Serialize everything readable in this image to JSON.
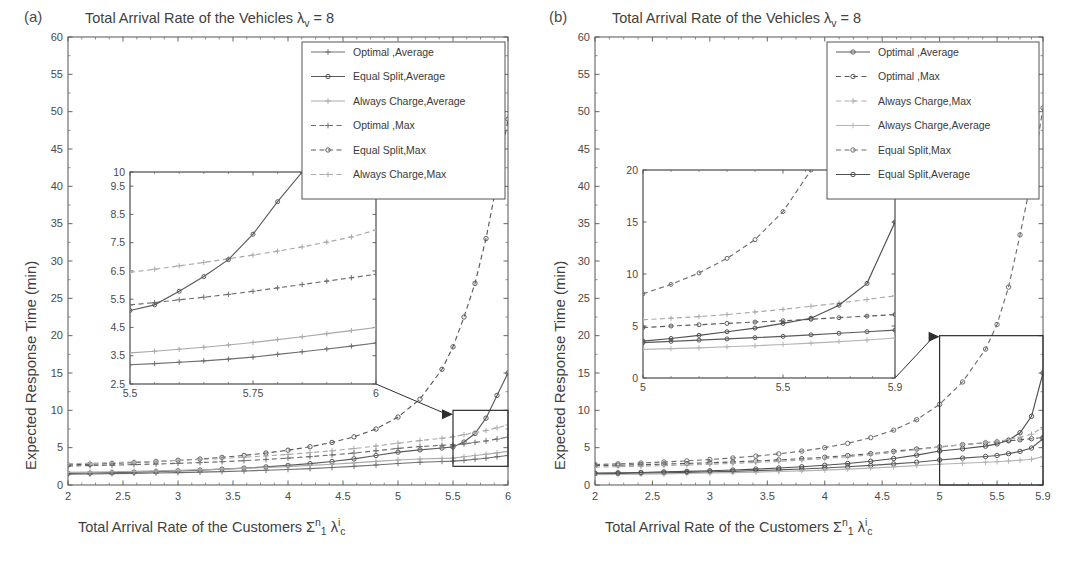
{
  "figure": {
    "width": 1078,
    "height": 565,
    "background": "#ffffff",
    "ink_color": "#4a4a4a"
  },
  "panels": [
    {
      "id": "a",
      "label": "(a)",
      "title_prefix": "Total Arrival Rate of the Vehicles ",
      "title_symbol": "λ",
      "title_sub": "v",
      "title_suffix": " = 8",
      "ylabel": "Expected Response Time (min)",
      "xlabel_prefix": "Total Arrival Rate of the Customers ",
      "xlabel_sigma": "Σ",
      "xlabel_sigma_sup": "n",
      "xlabel_sigma_sub": "1",
      "xlabel_lambda": "λ",
      "xlabel_lambda_sup": "i",
      "xlabel_lambda_sub": "c",
      "legend": [
        {
          "label": "Optimal ,Average",
          "style": "solid",
          "marker": "plus",
          "color": "#6e6e6e"
        },
        {
          "label": "Equal Split,Average",
          "style": "solid",
          "marker": "circle",
          "color": "#5a5a5a"
        },
        {
          "label": "Always Charge,Average",
          "style": "solid",
          "marker": "plus",
          "color": "#a9a9a9"
        },
        {
          "label": "Optimal ,Max",
          "style": "dashed",
          "marker": "plus",
          "color": "#6e6e6e"
        },
        {
          "label": "Equal Split,Max",
          "style": "dashed",
          "marker": "circle",
          "color": "#5a5a5a"
        },
        {
          "label": "Always Charge,Max",
          "style": "dashed",
          "marker": "plus",
          "color": "#a9a9a9"
        }
      ],
      "zoom_box": {
        "x0": 5.5,
        "x1": 6,
        "y0": 2.5,
        "y1": 10
      }
    },
    {
      "id": "b",
      "label": "(b)",
      "title_prefix": "Total Arrival Rate of the Vehicles ",
      "title_symbol": "λ",
      "title_sub": "v",
      "title_suffix": " = 8",
      "ylabel": "Expected Response Time (min)",
      "xlabel_prefix": "Total Arrival Rate of the Customers ",
      "xlabel_sigma": "Σ",
      "xlabel_sigma_sup": "n",
      "xlabel_sigma_sub": "1",
      "xlabel_lambda": "λ",
      "xlabel_lambda_sup": "i",
      "xlabel_lambda_sub": "c",
      "legend": [
        {
          "label": "Optimal ,Average",
          "style": "solid",
          "marker": "circle",
          "color": "#5a5a5a"
        },
        {
          "label": "Optimal ,Max",
          "style": "dashed",
          "marker": "circle",
          "color": "#5a5a5a"
        },
        {
          "label": "Always Charge,Max",
          "style": "dashed",
          "marker": "plus",
          "color": "#a9a9a9"
        },
        {
          "label": "Always Charge,Average",
          "style": "solid",
          "marker": "plus",
          "color": "#b4b4b4"
        },
        {
          "label": "Equal Split,Max",
          "style": "dashed",
          "marker": "circle",
          "color": "#6e6e6e"
        },
        {
          "label": "Equal Split,Average",
          "style": "solid",
          "marker": "circle",
          "color": "#4f4f4f"
        }
      ],
      "zoom_box": {
        "x0": 5.0,
        "x1": 5.9,
        "y0": 0,
        "y1": 20
      }
    }
  ],
  "chart_data": [
    {
      "id": "panel-a-main",
      "type": "line",
      "title": "Total Arrival Rate of the Vehicles λ_v = 8",
      "xlabel": "Total Arrival Rate of the Customers Σ_1^n λ_c^i",
      "ylabel": "Expected Response Time (min)",
      "xlim": [
        2,
        6
      ],
      "ylim": [
        0,
        60
      ],
      "xticks": [
        2,
        2.5,
        3,
        3.5,
        4,
        4.5,
        5,
        5.5,
        6
      ],
      "xticklabels": [
        "2",
        "2.5",
        "3",
        "3.5",
        "4",
        "4.5",
        "5",
        "5.5",
        "6"
      ],
      "yticks": [
        0,
        5,
        10,
        15,
        20,
        25,
        30,
        35,
        40,
        45,
        50,
        55,
        60
      ],
      "yticklabels": [
        "0",
        "5",
        "10",
        "15",
        "20",
        "25",
        "30",
        "35",
        "40",
        "45",
        "50",
        "55",
        "60"
      ],
      "grid": false,
      "legend_position": "upper-right",
      "x": [
        2,
        2.2,
        2.4,
        2.6,
        2.8,
        3.0,
        3.2,
        3.4,
        3.6,
        3.8,
        4.0,
        4.2,
        4.4,
        4.6,
        4.8,
        5.0,
        5.2,
        5.4,
        5.5,
        5.6,
        5.7,
        5.8,
        5.9,
        6.0
      ],
      "series": [
        {
          "name": "Optimal ,Average",
          "style": "solid",
          "marker": "plus",
          "color": "#6e6e6e",
          "values": [
            1.45,
            1.48,
            1.52,
            1.56,
            1.6,
            1.66,
            1.72,
            1.8,
            1.88,
            1.98,
            2.08,
            2.2,
            2.34,
            2.5,
            2.68,
            2.88,
            3.05,
            3.15,
            3.2,
            3.3,
            3.45,
            3.58,
            3.78,
            3.95
          ]
        },
        {
          "name": "Equal Split,Average",
          "style": "solid",
          "marker": "circle",
          "color": "#5a5a5a",
          "values": [
            1.55,
            1.6,
            1.66,
            1.72,
            1.8,
            1.9,
            2.0,
            2.12,
            2.26,
            2.42,
            2.62,
            2.86,
            3.14,
            3.5,
            3.95,
            4.4,
            4.7,
            4.95,
            5.1,
            5.75,
            6.9,
            8.95,
            12.0,
            15.0
          ]
        },
        {
          "name": "Always Charge,Average",
          "style": "solid",
          "marker": "plus",
          "color": "#a9a9a9",
          "values": [
            1.7,
            1.74,
            1.78,
            1.83,
            1.89,
            1.96,
            2.04,
            2.13,
            2.23,
            2.34,
            2.47,
            2.62,
            2.78,
            2.96,
            3.16,
            3.35,
            3.48,
            3.56,
            3.6,
            3.78,
            3.95,
            4.12,
            4.3,
            4.5
          ]
        },
        {
          "name": "Optimal ,Max",
          "style": "dashed",
          "marker": "plus",
          "color": "#6e6e6e",
          "values": [
            2.55,
            2.6,
            2.66,
            2.73,
            2.81,
            2.9,
            3.0,
            3.12,
            3.26,
            3.42,
            3.6,
            3.8,
            4.02,
            4.28,
            4.58,
            4.9,
            5.15,
            5.32,
            5.4,
            5.5,
            5.7,
            5.9,
            6.15,
            6.4
          ]
        },
        {
          "name": "Equal Split,Max",
          "style": "dashed",
          "marker": "circle",
          "color": "#5a5a5a",
          "values": [
            2.7,
            2.78,
            2.88,
            3.0,
            3.14,
            3.3,
            3.48,
            3.7,
            3.96,
            4.28,
            4.66,
            5.12,
            5.7,
            6.45,
            7.5,
            9.1,
            11.5,
            15.5,
            18.5,
            22.5,
            27.0,
            33.0,
            40.5,
            49.0
          ]
        },
        {
          "name": "Always Charge,Max",
          "style": "dashed",
          "marker": "plus",
          "color": "#a9a9a9",
          "values": [
            2.85,
            2.92,
            3.0,
            3.08,
            3.18,
            3.3,
            3.42,
            3.56,
            3.72,
            3.9,
            4.1,
            4.32,
            4.58,
            4.88,
            5.22,
            5.6,
            5.95,
            6.25,
            6.45,
            6.75,
            7.0,
            7.3,
            7.65,
            8.05
          ]
        }
      ]
    },
    {
      "id": "panel-a-inset",
      "type": "line",
      "xlim": [
        5.5,
        6
      ],
      "ylim": [
        2.5,
        10
      ],
      "xticks": [
        5.5,
        5.75,
        6
      ],
      "xticklabels": [
        "5.5",
        "5.75",
        "6"
      ],
      "yticks": [
        2.5,
        3.5,
        4.5,
        5.5,
        6.5,
        7.5,
        8.5,
        9.5,
        10
      ],
      "yticklabels": [
        "2.5",
        "3.5",
        "4.5",
        "5.5",
        "6.5",
        "7.5",
        "8.5",
        "9.5",
        "10"
      ],
      "x": [
        5.5,
        5.55,
        5.6,
        5.65,
        5.7,
        5.75,
        5.8,
        5.85,
        5.9,
        5.95,
        6.0
      ],
      "series": [
        {
          "name": "Optimal ,Average",
          "style": "solid",
          "marker": "plus",
          "color": "#6e6e6e",
          "values": [
            3.18,
            3.22,
            3.27,
            3.32,
            3.38,
            3.45,
            3.55,
            3.64,
            3.74,
            3.84,
            3.95
          ]
        },
        {
          "name": "Always Charge,Average",
          "style": "solid",
          "marker": "plus",
          "color": "#a9a9a9",
          "values": [
            3.6,
            3.66,
            3.73,
            3.8,
            3.88,
            3.97,
            4.07,
            4.17,
            4.28,
            4.39,
            4.5
          ]
        },
        {
          "name": "Optimal ,Max",
          "style": "dashed",
          "marker": "plus",
          "color": "#6e6e6e",
          "values": [
            5.3,
            5.38,
            5.48,
            5.57,
            5.67,
            5.78,
            5.9,
            6.02,
            6.14,
            6.26,
            6.38
          ]
        },
        {
          "name": "Always Charge,Max",
          "style": "dashed",
          "marker": "plus",
          "color": "#a9a9a9",
          "values": [
            6.45,
            6.56,
            6.68,
            6.8,
            6.93,
            7.06,
            7.2,
            7.35,
            7.52,
            7.7,
            7.95
          ]
        },
        {
          "name": "Equal Split,Average",
          "style": "solid",
          "marker": "circle",
          "color": "#5a5a5a",
          "values": [
            5.1,
            5.3,
            5.78,
            6.3,
            6.9,
            7.8,
            8.95,
            10.0,
            null,
            null,
            null
          ]
        }
      ]
    },
    {
      "id": "panel-b-main",
      "type": "line",
      "title": "Total Arrival Rate of the Vehicles λ_v = 8",
      "xlabel": "Total Arrival Rate of the Customers Σ_1^n λ_c^i",
      "ylabel": "Expected Response Time (min)",
      "xlim": [
        2,
        5.9
      ],
      "ylim": [
        0,
        60
      ],
      "xticks": [
        2,
        2.5,
        3,
        3.5,
        4,
        4.5,
        5,
        5.5,
        5.9
      ],
      "xticklabels": [
        "2",
        "2.5",
        "3",
        "3.5",
        "4",
        "4.5",
        "5",
        "5.5",
        "5.9"
      ],
      "yticks": [
        0,
        5,
        10,
        15,
        20,
        25,
        30,
        35,
        40,
        45,
        50,
        55,
        60
      ],
      "yticklabels": [
        "0",
        "5",
        "10",
        "15",
        "20",
        "25",
        "30",
        "35",
        "40",
        "45",
        "50",
        "55",
        "60"
      ],
      "grid": false,
      "legend_position": "upper-right",
      "x": [
        2,
        2.2,
        2.4,
        2.6,
        2.8,
        3.0,
        3.2,
        3.4,
        3.6,
        3.8,
        4.0,
        4.2,
        4.4,
        4.6,
        4.8,
        5.0,
        5.2,
        5.4,
        5.5,
        5.6,
        5.7,
        5.8,
        5.9
      ],
      "series": [
        {
          "name": "Optimal ,Average",
          "style": "solid",
          "marker": "circle",
          "color": "#5a5a5a",
          "values": [
            1.5,
            1.54,
            1.58,
            1.63,
            1.69,
            1.75,
            1.83,
            1.92,
            2.02,
            2.14,
            2.28,
            2.44,
            2.62,
            2.82,
            3.05,
            3.35,
            3.6,
            3.82,
            3.95,
            4.2,
            4.5,
            4.95,
            6.2
          ]
        },
        {
          "name": "Always Charge,Average",
          "style": "solid",
          "marker": "plus",
          "color": "#b4b4b4",
          "values": [
            1.38,
            1.41,
            1.45,
            1.49,
            1.54,
            1.6,
            1.66,
            1.73,
            1.81,
            1.9,
            2.0,
            2.12,
            2.26,
            2.42,
            2.6,
            2.78,
            2.92,
            3.05,
            3.12,
            3.22,
            3.32,
            3.45,
            3.8
          ]
        },
        {
          "name": "Equal Split,Average",
          "style": "solid",
          "marker": "circle",
          "color": "#4f4f4f",
          "values": [
            1.58,
            1.63,
            1.68,
            1.75,
            1.82,
            1.91,
            2.01,
            2.13,
            2.27,
            2.44,
            2.64,
            2.88,
            3.18,
            3.55,
            4.0,
            4.55,
            4.85,
            5.2,
            5.5,
            6.0,
            7.0,
            9.2,
            15.0
          ]
        },
        {
          "name": "Optimal ,Max",
          "style": "dashed",
          "marker": "circle",
          "color": "#5a5a5a",
          "values": [
            2.6,
            2.66,
            2.72,
            2.8,
            2.88,
            2.98,
            3.09,
            3.22,
            3.36,
            3.53,
            3.72,
            3.94,
            4.2,
            4.5,
            4.82,
            5.1,
            5.4,
            5.65,
            5.78,
            5.92,
            6.05,
            6.2,
            6.35
          ]
        },
        {
          "name": "Always Charge,Max",
          "style": "dashed",
          "marker": "plus",
          "color": "#a9a9a9",
          "values": [
            2.4,
            2.46,
            2.52,
            2.6,
            2.68,
            2.78,
            2.89,
            3.02,
            3.17,
            3.34,
            3.54,
            3.78,
            4.06,
            4.38,
            4.74,
            5.08,
            5.4,
            5.68,
            5.85,
            6.1,
            6.4,
            6.8,
            7.7
          ]
        },
        {
          "name": "Equal Split,Max",
          "style": "dashed",
          "marker": "circle",
          "color": "#6e6e6e",
          "values": [
            2.75,
            2.84,
            2.95,
            3.08,
            3.23,
            3.41,
            3.62,
            3.87,
            4.17,
            4.54,
            5.0,
            5.58,
            6.34,
            7.35,
            8.75,
            10.8,
            13.8,
            18.2,
            21.5,
            26.5,
            33.5,
            41.0,
            50.5
          ]
        }
      ]
    },
    {
      "id": "panel-b-inset",
      "type": "line",
      "xlim": [
        5.0,
        5.9
      ],
      "ylim": [
        0,
        20
      ],
      "xticks": [
        5.0,
        5.5,
        5.9
      ],
      "xticklabels": [
        "5",
        "5.5",
        "5.9"
      ],
      "yticks": [
        0,
        5,
        10,
        15,
        20
      ],
      "yticklabels": [
        "0",
        "5",
        "10",
        "15",
        "20"
      ],
      "x": [
        5.0,
        5.1,
        5.2,
        5.3,
        5.4,
        5.5,
        5.6,
        5.7,
        5.8,
        5.9
      ],
      "series": [
        {
          "name": "Equal Split,Max",
          "style": "dashed",
          "marker": "circle",
          "color": "#6e6e6e",
          "values": [
            8.1,
            9.0,
            10.1,
            11.5,
            13.3,
            16.0,
            20.0,
            null,
            null,
            null
          ]
        },
        {
          "name": "Always Charge,Max",
          "style": "dashed",
          "marker": "plus",
          "color": "#a9a9a9",
          "values": [
            5.6,
            5.75,
            5.9,
            6.1,
            6.35,
            6.6,
            6.9,
            7.2,
            7.55,
            7.9
          ]
        },
        {
          "name": "Optimal ,Max",
          "style": "dashed",
          "marker": "circle",
          "color": "#5a5a5a",
          "values": [
            4.85,
            5.0,
            5.12,
            5.25,
            5.38,
            5.5,
            5.65,
            5.8,
            5.95,
            6.1
          ]
        },
        {
          "name": "Equal Split,Average",
          "style": "solid",
          "marker": "circle",
          "color": "#4f4f4f",
          "values": [
            3.55,
            3.8,
            4.1,
            4.45,
            4.8,
            5.25,
            5.75,
            7.0,
            9.1,
            15.0
          ]
        },
        {
          "name": "Optimal ,Average",
          "style": "solid",
          "marker": "circle",
          "color": "#5a5a5a",
          "values": [
            3.4,
            3.52,
            3.64,
            3.76,
            3.88,
            4.0,
            4.15,
            4.3,
            4.45,
            4.6
          ]
        },
        {
          "name": "Always Charge,Average",
          "style": "solid",
          "marker": "plus",
          "color": "#b4b4b4",
          "values": [
            2.75,
            2.82,
            2.9,
            3.0,
            3.1,
            3.22,
            3.35,
            3.5,
            3.65,
            3.85
          ]
        }
      ]
    }
  ]
}
